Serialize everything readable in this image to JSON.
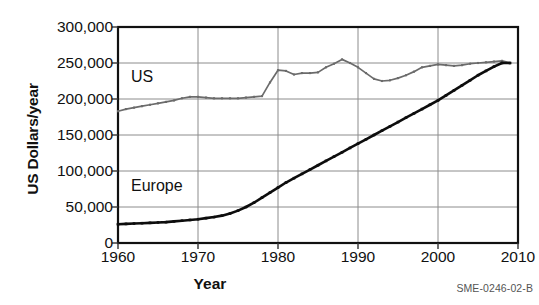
{
  "figure": {
    "caption": "SME-0246-02-B",
    "series_labels": {
      "us": "US",
      "europe": "Europe"
    }
  },
  "chart_data": {
    "type": "line",
    "title": "",
    "xlabel": "Year",
    "ylabel": "US Dollars/year",
    "xlim": [
      1960,
      2010
    ],
    "ylim": [
      0,
      300000
    ],
    "grid": true,
    "legend": "inline-annotation",
    "xticks": [
      1960,
      1970,
      1980,
      1990,
      2000,
      2010
    ],
    "xtick_labels": [
      "1960",
      "1970",
      "1980",
      "1990",
      "2000",
      "2010"
    ],
    "yticks": [
      0,
      50000,
      100000,
      150000,
      200000,
      250000,
      300000
    ],
    "ytick_labels": [
      "0",
      "50,000",
      "100,000",
      "150,000",
      "200,000",
      "250,000",
      "300,000"
    ],
    "series": [
      {
        "name": "US",
        "color": "#6b6b6b",
        "marker": "square",
        "x": [
          1960,
          1961,
          1962,
          1963,
          1964,
          1965,
          1966,
          1967,
          1968,
          1969,
          1970,
          1971,
          1972,
          1973,
          1974,
          1975,
          1976,
          1977,
          1978,
          1979,
          1980,
          1981,
          1982,
          1983,
          1984,
          1985,
          1986,
          1987,
          1988,
          1989,
          1990,
          1991,
          1992,
          1993,
          1994,
          1995,
          1996,
          1997,
          1998,
          1999,
          2000,
          2001,
          2002,
          2003,
          2004,
          2005,
          2006,
          2007,
          2008,
          2009
        ],
        "values": [
          183000,
          186000,
          188000,
          190000,
          192000,
          194000,
          196000,
          198000,
          201000,
          203000,
          203000,
          202000,
          201000,
          201000,
          201000,
          201000,
          202000,
          203000,
          204000,
          223000,
          240000,
          239000,
          234000,
          236000,
          236000,
          237000,
          244000,
          249000,
          255000,
          250000,
          244000,
          236000,
          228000,
          225000,
          226000,
          229000,
          233000,
          238000,
          244000,
          246000,
          248000,
          247000,
          246000,
          247000,
          249000,
          250000,
          251000,
          252000,
          253000,
          250000
        ]
      },
      {
        "name": "Europe",
        "color": "#0d0d0d",
        "marker": "square",
        "x": [
          1960,
          1961,
          1962,
          1963,
          1964,
          1965,
          1966,
          1967,
          1968,
          1969,
          1970,
          1971,
          1972,
          1973,
          1974,
          1975,
          1976,
          1977,
          1978,
          1979,
          1980,
          1981,
          1982,
          1983,
          1984,
          1985,
          1986,
          1987,
          1988,
          1989,
          1990,
          1991,
          1992,
          1993,
          1994,
          1995,
          1996,
          1997,
          1998,
          1999,
          2000,
          2001,
          2002,
          2003,
          2004,
          2005,
          2006,
          2007,
          2008,
          2009
        ],
        "values": [
          26000,
          26500,
          27000,
          27500,
          28000,
          28500,
          29000,
          30000,
          31000,
          32000,
          33000,
          34500,
          36000,
          38000,
          41000,
          45000,
          50000,
          56000,
          63000,
          70000,
          77000,
          84000,
          90000,
          96000,
          102000,
          108000,
          114000,
          120000,
          126000,
          132000,
          138000,
          144000,
          150000,
          156000,
          162000,
          168000,
          174000,
          180000,
          186000,
          192000,
          198000,
          205000,
          212000,
          219000,
          226000,
          233000,
          239000,
          245000,
          250000,
          250000
        ]
      }
    ]
  }
}
